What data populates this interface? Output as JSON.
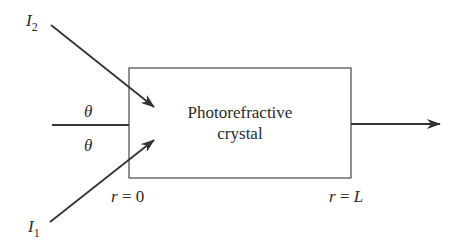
{
  "diagram": {
    "crystal": {
      "line1": "Photorefractive",
      "line2": "crystal"
    },
    "beams": {
      "I2": {
        "symbol": "I",
        "subscript": "2"
      },
      "I1": {
        "symbol": "I",
        "subscript": "1"
      }
    },
    "angles": {
      "upper": "θ",
      "lower": "θ"
    },
    "positions": {
      "start": {
        "var": "r",
        "eq": " = ",
        "val": "0"
      },
      "end": {
        "var": "r",
        "eq": " = ",
        "val": "L"
      }
    },
    "colors": {
      "line": "#333333",
      "box": "#555555",
      "background": "#ffffff"
    }
  }
}
